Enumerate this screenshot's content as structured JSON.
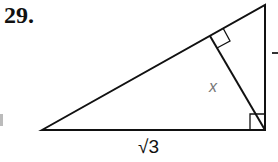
{
  "problem": {
    "number": "29.",
    "labels": {
      "altitude": "x",
      "base": "√3"
    }
  },
  "figure": {
    "type": "right-triangle-with-altitude",
    "stroke_color": "#111111",
    "vertices": {
      "left": [
        42,
        130
      ],
      "top_right": [
        265,
        5
      ],
      "bottom_right": [
        265,
        130
      ]
    },
    "altitude_foot": [
      210,
      36
    ],
    "right_angle_marks": [
      "bottom_right",
      "altitude_foot"
    ]
  }
}
